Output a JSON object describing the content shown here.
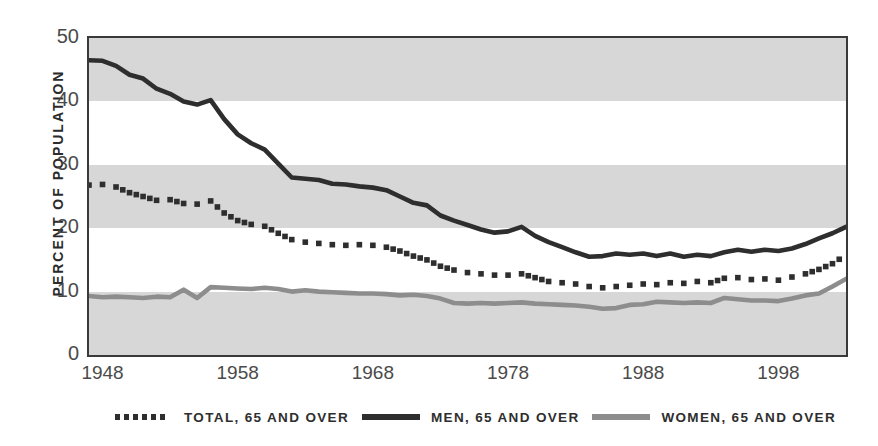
{
  "axes": {
    "ylabel": "PERCENT OF POPULATION",
    "yticks": [
      "50",
      "40",
      "30",
      "20",
      "10",
      "0"
    ],
    "xticks": [
      "1948",
      "1958",
      "1968",
      "1978",
      "1988",
      "1998"
    ]
  },
  "legend": [
    {
      "label": "TOTAL, 65 AND OVER",
      "style": "dotted",
      "color": "#2e2e2e"
    },
    {
      "label": "MEN, 65 AND OVER",
      "style": "solid",
      "color": "#2e2e2e"
    },
    {
      "label": "WOMEN, 65 AND OVER",
      "style": "solid",
      "color": "#8d8d8d"
    }
  ],
  "colors": {
    "band": "#d7d7d7",
    "plot_background": "#ffffff",
    "axis": "#3a3a3a",
    "men": "#2e2e2e",
    "total": "#2e2e2e",
    "women": "#8d8d8d",
    "tick_text": "#4a4a4a"
  },
  "bands": [
    {
      "from": 40,
      "to": 50
    },
    {
      "from": 20,
      "to": 30
    },
    {
      "from": 0,
      "to": 10
    }
  ],
  "chart_data": {
    "type": "line",
    "title": "",
    "xlabel": "",
    "ylabel": "PERCENT OF POPULATION",
    "xlim": [
      1947,
      2003
    ],
    "ylim": [
      0,
      50
    ],
    "yticks": [
      0,
      10,
      20,
      30,
      40,
      50
    ],
    "xticks": [
      1948,
      1958,
      1968,
      1978,
      1988,
      1998
    ],
    "grid": false,
    "legend_position": "bottom",
    "x": [
      1947,
      1948,
      1949,
      1950,
      1951,
      1952,
      1953,
      1954,
      1955,
      1956,
      1957,
      1958,
      1959,
      1960,
      1961,
      1962,
      1963,
      1964,
      1965,
      1966,
      1967,
      1968,
      1969,
      1970,
      1971,
      1972,
      1973,
      1974,
      1975,
      1976,
      1977,
      1978,
      1979,
      1980,
      1981,
      1982,
      1983,
      1984,
      1985,
      1986,
      1987,
      1988,
      1989,
      1990,
      1991,
      1992,
      1993,
      1994,
      1995,
      1996,
      1997,
      1998,
      1999,
      2000,
      2001,
      2002,
      2003
    ],
    "series": [
      {
        "name": "MEN, 65 AND OVER",
        "style": "solid",
        "color": "#2e2e2e",
        "values": [
          46.5,
          46.4,
          45.6,
          44.2,
          43.6,
          42.0,
          41.2,
          40.0,
          39.5,
          40.2,
          37.2,
          34.8,
          33.4,
          32.4,
          30.2,
          28.0,
          27.8,
          27.6,
          27.0,
          26.9,
          26.6,
          26.4,
          26.0,
          25.0,
          24.0,
          23.6,
          22.0,
          21.2,
          20.5,
          19.8,
          19.3,
          19.5,
          20.2,
          18.8,
          17.8,
          17.0,
          16.2,
          15.5,
          15.6,
          16.0,
          15.8,
          16.0,
          15.6,
          16.0,
          15.5,
          15.8,
          15.6,
          16.2,
          16.6,
          16.3,
          16.6,
          16.4,
          16.8,
          17.5,
          18.4,
          19.2,
          20.2
        ]
      },
      {
        "name": "TOTAL, 65 AND OVER",
        "style": "dotted",
        "color": "#2e2e2e",
        "values": [
          26.8,
          26.9,
          26.5,
          25.6,
          25.0,
          24.4,
          24.5,
          23.9,
          23.8,
          24.3,
          22.4,
          21.2,
          20.6,
          20.3,
          19.2,
          18.2,
          17.8,
          17.6,
          17.4,
          17.3,
          17.4,
          17.3,
          17.0,
          16.4,
          15.6,
          15.0,
          14.0,
          13.4,
          13.0,
          12.8,
          12.6,
          12.6,
          12.8,
          12.2,
          11.6,
          11.4,
          11.2,
          10.8,
          10.6,
          10.8,
          11.0,
          11.2,
          11.1,
          11.4,
          11.3,
          11.6,
          11.4,
          12.1,
          12.2,
          11.9,
          12.0,
          11.8,
          12.3,
          12.8,
          13.5,
          14.4,
          15.8
        ]
      },
      {
        "name": "WOMEN, 65 AND OVER",
        "style": "solid",
        "color": "#8d8d8d",
        "values": [
          9.3,
          9.1,
          9.2,
          9.1,
          9.0,
          9.2,
          9.1,
          10.3,
          9.0,
          10.7,
          10.6,
          10.5,
          10.4,
          10.6,
          10.4,
          10.0,
          10.2,
          10.0,
          9.9,
          9.8,
          9.7,
          9.7,
          9.6,
          9.4,
          9.5,
          9.3,
          8.9,
          8.2,
          8.1,
          8.2,
          8.1,
          8.2,
          8.3,
          8.1,
          8.0,
          7.9,
          7.8,
          7.6,
          7.3,
          7.4,
          7.9,
          8.0,
          8.4,
          8.3,
          8.2,
          8.3,
          8.2,
          9.0,
          8.8,
          8.6,
          8.6,
          8.5,
          8.9,
          9.4,
          9.7,
          10.8,
          12.0
        ]
      }
    ]
  }
}
